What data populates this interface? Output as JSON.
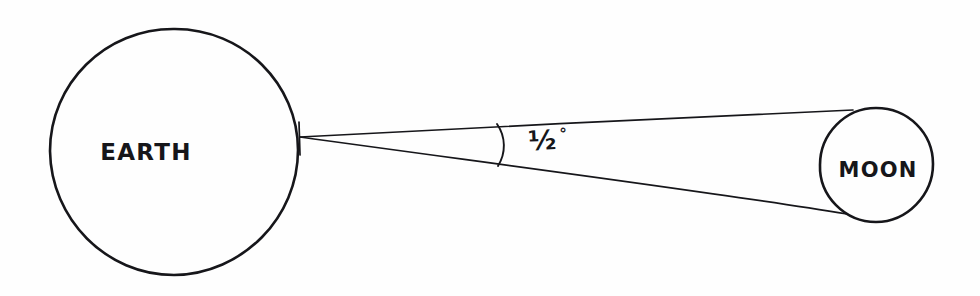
{
  "diagram": {
    "style": "hand-drawn ink on white paper",
    "background_color": "#fefefe",
    "ink_color": "#16161a",
    "bodies": [
      {
        "name": "earth",
        "label": "EARTH",
        "shape": "circle",
        "center_x": 175,
        "center_y": 152,
        "radius": 123
      },
      {
        "name": "moon",
        "label": "MOON",
        "shape": "circle",
        "center_x": 876,
        "center_y": 165,
        "radius": 57
      }
    ],
    "angle": {
      "value": "1/2",
      "fraction_glyph": "½",
      "degree_symbol": "°",
      "full_label": "½°",
      "vertex_x": 300,
      "vertex_y": 137,
      "arc_x": 500,
      "arc_top_y": 125,
      "arc_bottom_y": 165
    },
    "sight_lines": [
      {
        "name": "upper-sight-line",
        "from_x": 300,
        "from_y": 137,
        "to_x": 853,
        "to_y": 110
      },
      {
        "name": "lower-sight-line",
        "from_x": 300,
        "from_y": 137,
        "to_x": 847,
        "to_y": 214
      }
    ]
  }
}
